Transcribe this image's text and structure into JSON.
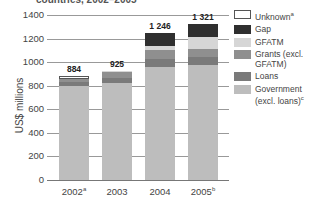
{
  "title": "countries, 2002–2005",
  "chart_data": {
    "type": "bar",
    "stacked": true,
    "title": "countries, 2002–2005",
    "xlabel": "",
    "ylabel": "US$ millions",
    "ylim": [
      0,
      1400
    ],
    "yticks": [
      0,
      200,
      400,
      600,
      800,
      1000,
      1200,
      1400
    ],
    "grid": true,
    "legend_position": "right",
    "categories": [
      "2002",
      "2003",
      "2004",
      "2005"
    ],
    "category_superscripts": [
      "a",
      "",
      "",
      "b"
    ],
    "totals": [
      884,
      925,
      1246,
      1321
    ],
    "total_labels": [
      "884",
      "925",
      "1 246",
      "1 321"
    ],
    "series": [
      {
        "name": "Government (excl. loans)",
        "superscript": "c",
        "color": "#bdbdbd",
        "values": [
          800,
          820,
          955,
          975
        ]
      },
      {
        "name": "Loans",
        "color": "#7a7a7a",
        "values": [
          30,
          45,
          70,
          70
        ]
      },
      {
        "name": "Grants (excl. GFATM)",
        "color": "#8f8f8f",
        "values": [
          30,
          55,
          75,
          65
        ]
      },
      {
        "name": "GFATM",
        "color": "#d6d6d6",
        "values": [
          0,
          5,
          36,
          105
        ]
      },
      {
        "name": "Gap",
        "color": "#2f2f2f",
        "values": [
          0,
          0,
          110,
          106
        ]
      },
      {
        "name": "Unknown",
        "superscript": "a",
        "color": "#ffffff",
        "values": [
          24,
          0,
          0,
          0
        ]
      }
    ]
  },
  "axis": {
    "ylabel": "US$ millions",
    "yticks": [
      "0",
      "200",
      "400",
      "600",
      "800",
      "1000",
      "1200",
      "1400"
    ]
  },
  "x_labels": [
    {
      "text": "2002",
      "sup": "a"
    },
    {
      "text": "2003",
      "sup": ""
    },
    {
      "text": "2004",
      "sup": ""
    },
    {
      "text": "2005",
      "sup": "b"
    }
  ],
  "totals": [
    "884",
    "925",
    "1 246",
    "1 321"
  ],
  "legend": [
    {
      "label": "Unknown",
      "sup": "a",
      "color": "#ffffff"
    },
    {
      "label": "Gap",
      "sup": "",
      "color": "#2f2f2f"
    },
    {
      "label": "GFATM",
      "sup": "",
      "color": "#d6d6d6"
    },
    {
      "label": "Grants (excl. GFATM)",
      "sup": "",
      "color": "#8f8f8f"
    },
    {
      "label": "Loans",
      "sup": "",
      "color": "#7a7a7a"
    },
    {
      "label": "Government (excl. loans)",
      "sup": "c",
      "color": "#bdbdbd"
    }
  ]
}
